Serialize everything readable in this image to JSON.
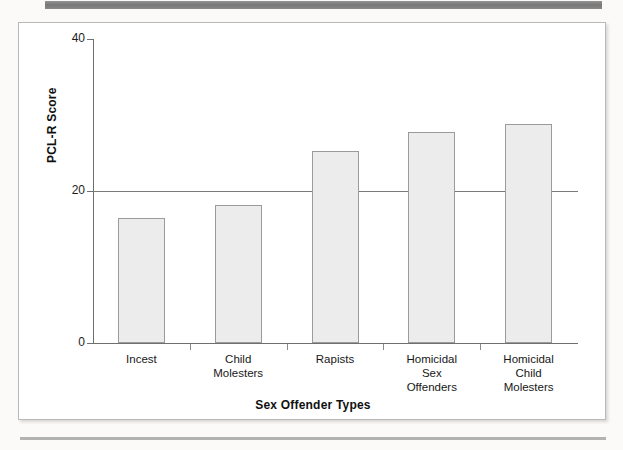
{
  "figure": {
    "background_color": "#fbfaf8",
    "frame_color": "#ffffff"
  },
  "chart_data": {
    "type": "bar",
    "title": "",
    "xlabel": "Sex Offender Types",
    "ylabel": "PCL-R Score",
    "categories": [
      "Incest",
      "Child\nMolesters",
      "Rapists",
      "Homicidal\nSex\nOffenders",
      "Homicidal\nChild\nMolesters"
    ],
    "values": [
      16.4,
      18.2,
      25.3,
      27.8,
      28.8
    ],
    "ylim": [
      0,
      40
    ],
    "ytick_labels": [
      "40",
      "20",
      "0"
    ],
    "ytick_values": [
      40,
      20,
      0
    ],
    "grid": false,
    "legend": "none",
    "reference_line": {
      "value": 20,
      "label": ""
    },
    "bar_fill_color": "#ececec",
    "bar_edge_color": "#9b9b9b",
    "axis_color": "#6f6f6f"
  }
}
